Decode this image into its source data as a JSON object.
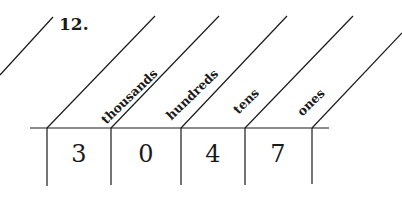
{
  "exercise": {
    "number": "12.",
    "place_value_chart": {
      "headers": [
        "thousands",
        "hundreds",
        "tens",
        "ones"
      ],
      "digits": [
        "3",
        "0",
        "4",
        "7"
      ]
    }
  },
  "colors": {
    "ink": "#1a1a1a",
    "paper": "#ffffff"
  }
}
